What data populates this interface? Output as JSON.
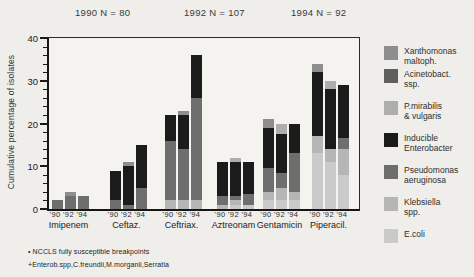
{
  "header": {
    "annotations": [
      "1990 N = 80",
      "1992 N = 107",
      "1994 N = 92"
    ]
  },
  "footnotes": [
    "• NCCLS fully susceptible breakpoints",
    "+Enterob.spp,C.freundii,M.morganii,Serratia"
  ],
  "colors": {
    "background": "#efeeeb",
    "axis": "#1a1a1a",
    "text": "#2a2a2a"
  },
  "chart_data": {
    "type": "bar",
    "variant": "stacked",
    "title": "",
    "ylabel": "Cumulative percentage of isolates",
    "xlabel": "",
    "ylim": [
      0,
      40
    ],
    "yticks_major": [
      0,
      10,
      20,
      30,
      40
    ],
    "ytick_minor_step": 2,
    "grid": false,
    "legend_position": "right",
    "series": [
      {
        "key": "xanthomonas",
        "label": "Xanthomonas\nmaltoph.",
        "color": "#8e8e8e"
      },
      {
        "key": "acinetobacter",
        "label": "Acinetobact.\nssp.",
        "color": "#5f5f5f"
      },
      {
        "key": "pmirabilis",
        "label": "P.mirabilis\n& vulgaris",
        "color": "#aeaeae"
      },
      {
        "key": "enterobacter",
        "label": "Inducible\nEnterobacter",
        "color": "#1b1b1b"
      },
      {
        "key": "pseudomonas",
        "label": "Pseudomonas\naeruginosa",
        "color": "#6e6e6e"
      },
      {
        "key": "klebsiella",
        "label": "Klebsiella\nspp.",
        "color": "#b6b6b6"
      },
      {
        "key": "ecoli",
        "label": "E.coli",
        "color": "#cacaca"
      }
    ],
    "stack_order": [
      "ecoli",
      "klebsiella",
      "pseudomonas",
      "enterobacter",
      "pmirabilis",
      "acinetobacter",
      "xanthomonas"
    ],
    "groups": [
      {
        "label": "Imipenem",
        "bars": [
          {
            "year": "'90",
            "total": 2,
            "segments": {
              "pseudomonas": 2
            }
          },
          {
            "year": "'92",
            "total": 4,
            "segments": {
              "pseudomonas": 3,
              "xanthomonas": 1
            }
          },
          {
            "year": "'94",
            "total": 3,
            "segments": {
              "pseudomonas": 3
            }
          }
        ]
      },
      {
        "label": "Ceftaz.",
        "bars": [
          {
            "year": "'90",
            "total": 9,
            "segments": {
              "pseudomonas": 2,
              "enterobacter": 7
            }
          },
          {
            "year": "'92",
            "total": 11,
            "segments": {
              "pseudomonas": 1,
              "enterobacter": 9,
              "xanthomonas": 1
            }
          },
          {
            "year": "'94",
            "total": 15,
            "segments": {
              "pseudomonas": 5,
              "enterobacter": 10
            }
          }
        ]
      },
      {
        "label": "Ceftriax.",
        "bars": [
          {
            "year": "'90",
            "total": 22,
            "segments": {
              "klebsiella": 2,
              "pseudomonas": 14,
              "enterobacter": 6
            }
          },
          {
            "year": "'92",
            "total": 23,
            "segments": {
              "klebsiella": 2,
              "pseudomonas": 12,
              "enterobacter": 8,
              "xanthomonas": 1
            }
          },
          {
            "year": "'94",
            "total": 36,
            "segments": {
              "klebsiella": 2,
              "pseudomonas": 24,
              "enterobacter": 10
            }
          }
        ]
      },
      {
        "label": "Aztreonam",
        "bars": [
          {
            "year": "'90",
            "total": 11,
            "segments": {
              "klebsiella": 1,
              "pseudomonas": 2,
              "enterobacter": 8
            }
          },
          {
            "year": "'92",
            "total": 12,
            "segments": {
              "ecoli": 1,
              "klebsiella": 1,
              "pseudomonas": 1,
              "enterobacter": 8,
              "pmirabilis": 1
            }
          },
          {
            "year": "'94",
            "total": 11,
            "segments": {
              "ecoli": 1,
              "pseudomonas": 2.5,
              "enterobacter": 7.5
            }
          }
        ]
      },
      {
        "label": "Gentamicin",
        "bars": [
          {
            "year": "'90",
            "total": 21,
            "segments": {
              "ecoli": 2,
              "klebsiella": 2,
              "pseudomonas": 5.5,
              "enterobacter": 9.5,
              "xanthomonas": 2
            }
          },
          {
            "year": "'92",
            "total": 20,
            "segments": {
              "ecoli": 2,
              "klebsiella": 3,
              "pseudomonas": 3.5,
              "enterobacter": 9,
              "pmirabilis": 2.5
            }
          },
          {
            "year": "'94",
            "total": 20,
            "segments": {
              "ecoli": 2,
              "klebsiella": 2,
              "pseudomonas": 9,
              "enterobacter": 7
            }
          }
        ]
      },
      {
        "label": "Piperacil.",
        "bars": [
          {
            "year": "'90",
            "total": 34,
            "segments": {
              "ecoli": 13,
              "klebsiella": 4,
              "enterobacter": 15,
              "xanthomonas": 2
            }
          },
          {
            "year": "'92",
            "total": 30,
            "segments": {
              "ecoli": 11,
              "klebsiella": 3,
              "enterobacter": 14,
              "pmirabilis": 2
            }
          },
          {
            "year": "'94",
            "total": 29,
            "segments": {
              "ecoli": 8,
              "klebsiella": 6,
              "pseudomonas": 2.5,
              "enterobacter": 12.5
            }
          }
        ]
      }
    ]
  }
}
